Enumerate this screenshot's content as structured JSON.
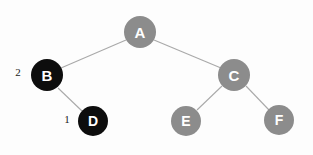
{
  "diagram": {
    "type": "binary-tree",
    "background_color": "#fdfdfd",
    "edge_color": "#a9a9a9",
    "node_dark_color": "#0d0d0d",
    "node_gray_color": "#8c8c8c",
    "node_text_color": "#ffffff",
    "annotation_text_color": "#1a1a1a",
    "nodes": [
      {
        "id": "A",
        "label": "A",
        "cx": 140,
        "cy": 32,
        "r": 16,
        "fill": "gray",
        "font_size": 15
      },
      {
        "id": "B",
        "label": "B",
        "cx": 47,
        "cy": 75,
        "r": 16,
        "fill": "dark",
        "font_size": 15
      },
      {
        "id": "C",
        "label": "C",
        "cx": 234,
        "cy": 75,
        "r": 16,
        "fill": "gray",
        "font_size": 15
      },
      {
        "id": "D",
        "label": "D",
        "cx": 93,
        "cy": 121,
        "r": 15,
        "fill": "dark",
        "font_size": 14
      },
      {
        "id": "E",
        "label": "E",
        "cx": 186,
        "cy": 121,
        "r": 15,
        "fill": "gray",
        "font_size": 14
      },
      {
        "id": "F",
        "label": "F",
        "cx": 279,
        "cy": 120,
        "r": 15,
        "fill": "gray",
        "font_size": 14
      }
    ],
    "edges": [
      {
        "id": "A-B",
        "from": "A",
        "to": "B",
        "x1": 126,
        "y1": 40,
        "x2": 61,
        "y2": 68
      },
      {
        "id": "A-C",
        "from": "A",
        "to": "C",
        "x1": 154,
        "y1": 40,
        "x2": 221,
        "y2": 68
      },
      {
        "id": "B-D",
        "from": "B",
        "to": "D",
        "x1": 58,
        "y1": 88,
        "x2": 82,
        "y2": 111
      },
      {
        "id": "C-E",
        "from": "C",
        "to": "E",
        "x1": 222,
        "y1": 86,
        "x2": 197,
        "y2": 110
      },
      {
        "id": "C-F",
        "from": "C",
        "to": "F",
        "x1": 246,
        "y1": 86,
        "x2": 269,
        "y2": 110
      }
    ],
    "annotations": [
      {
        "id": "weight-b",
        "text": "2",
        "x": 18,
        "y": 72,
        "for_node": "B"
      },
      {
        "id": "weight-d",
        "text": "1",
        "x": 67,
        "y": 119,
        "for_node": "D"
      }
    ]
  }
}
